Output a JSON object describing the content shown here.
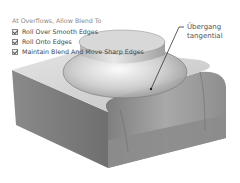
{
  "options_panel": {
    "heading": "At Overflows, Allow Blend To",
    "items": [
      {
        "label": "Roll Over Smooth Edges",
        "checked": true
      },
      {
        "label": "Roll Onto Edges",
        "checked": true
      },
      {
        "label": "Maintain Blend And Move Sharp Edges",
        "checked": true
      }
    ]
  },
  "callout": {
    "line1": "Übergang",
    "line2": "tangential"
  },
  "colors": {
    "block_side": "#7a7a7a",
    "block_top": "#cfcfcf",
    "blend": "#b5b5b5",
    "leader": "#333333"
  }
}
